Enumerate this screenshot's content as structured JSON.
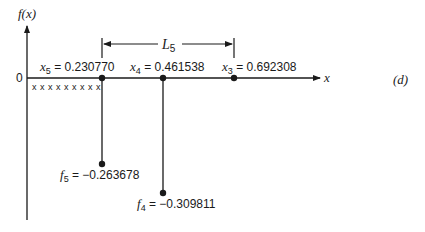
{
  "diagram": {
    "panel_label": "(d)",
    "y_axis_label": "f(x)",
    "x_axis_label": "x",
    "origin_label": "0",
    "eliminated_marks": "x x x x x x x x x",
    "interval": {
      "label": "L",
      "subscript": "5"
    },
    "points": [
      {
        "name": "x",
        "sub": "5",
        "eq": " = 0.230770",
        "value": 0.23077
      },
      {
        "name": "x",
        "sub": "4",
        "eq": " = 0.461538",
        "value": 0.461538
      },
      {
        "name": "x",
        "sub": "3",
        "eq": " = 0.692308",
        "value": 0.692308
      }
    ],
    "function_values": [
      {
        "name": "f",
        "sub": "5",
        "eq": " = −0.263678",
        "value": -0.263678
      },
      {
        "name": "f",
        "sub": "4",
        "eq": " = −0.309811",
        "value": -0.309811
      }
    ],
    "colors": {
      "ink": "#1a1a1a",
      "background": "#ffffff"
    }
  }
}
